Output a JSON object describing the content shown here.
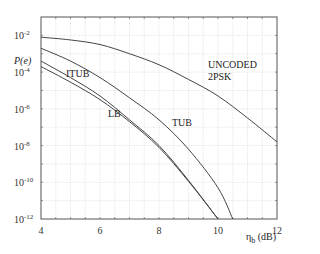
{
  "chart_data": {
    "type": "line",
    "title": "",
    "xlabel": "η_b (dB)",
    "ylabel": "P(e)",
    "xlim": [
      4,
      12
    ],
    "ylim_log10": [
      -12,
      -1
    ],
    "yscale": "log",
    "grid": true,
    "x_ticks": [
      4,
      6,
      8,
      10,
      12
    ],
    "y_ticks": [
      "10^-2",
      "10^-4",
      "10^-6",
      "10^-8",
      "10^-10",
      "10^-12"
    ],
    "legend": "inline labels",
    "series": [
      {
        "name": "UNCODED 2PSK",
        "x": [
          4,
          5,
          6,
          7,
          8,
          9,
          10,
          11,
          12
        ],
        "log10_y": [
          -2.1,
          -2.25,
          -2.5,
          -3.0,
          -3.6,
          -4.4,
          -5.3,
          -6.5,
          -7.8
        ]
      },
      {
        "name": "TUB",
        "x": [
          4,
          5,
          6,
          7,
          8,
          9,
          10,
          10.5
        ],
        "log10_y": [
          -2.7,
          -3.4,
          -4.3,
          -5.4,
          -6.6,
          -8.2,
          -10.3,
          -12.0
        ]
      },
      {
        "name": "ITUB",
        "x": [
          4,
          5,
          6,
          7,
          8,
          9,
          10
        ],
        "log10_y": [
          -3.4,
          -4.3,
          -5.3,
          -6.6,
          -8.0,
          -9.9,
          -12.0
        ]
      },
      {
        "name": "LB",
        "x": [
          4,
          5,
          6,
          7,
          8,
          9,
          10
        ],
        "log10_y": [
          -3.7,
          -4.55,
          -5.5,
          -6.7,
          -8.1,
          -9.95,
          -12.0
        ]
      }
    ]
  },
  "labels": {
    "ylabel": "P(e)",
    "xlabel_main": "η",
    "xlabel_sub": "b",
    "xlabel_unit": " (dB)",
    "uncoded_line1": "UNCODED",
    "uncoded_line2": "2PSK",
    "tub": "TUB",
    "itub": "ITUB",
    "lb": "LB"
  },
  "ticks": {
    "x": [
      "4",
      "6",
      "8",
      "10",
      "12"
    ],
    "y_base": "10",
    "y_exp": [
      "-2",
      "-4",
      "-6",
      "-8",
      "-10",
      "-12"
    ]
  }
}
